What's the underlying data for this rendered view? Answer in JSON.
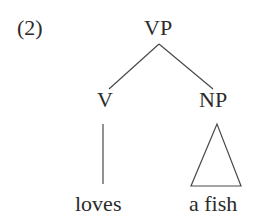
{
  "example_number": "(2)",
  "tree": {
    "root": {
      "label": "VP"
    },
    "children": [
      {
        "label": "V",
        "terminal": "loves",
        "edge": "line"
      },
      {
        "label": "NP",
        "terminal": "a fish",
        "edge": "triangle"
      }
    ]
  }
}
